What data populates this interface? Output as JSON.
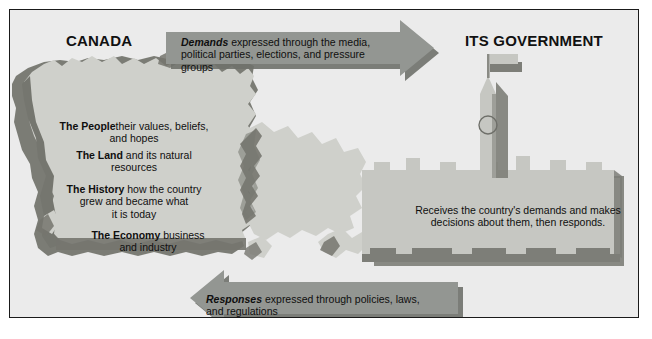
{
  "figure": {
    "background_color": "#ebebeb",
    "frame_color": "#1a1a1a",
    "map_fill": "#cfd0cb",
    "map_shadow": "#75766f",
    "building_fill": "#c6c7c2",
    "building_shadow": "#7d7e78",
    "arrow_fill": "#939692",
    "arrow_shadow": "#6f716c",
    "text_color": "#0f0f0f"
  },
  "titles": {
    "left": "CANADA",
    "right": "ITS GOVERNMENT"
  },
  "flows": [
    {
      "id": "demands",
      "direction": "right",
      "label": "Demands",
      "text": " expressed through the media, political parties, elections, and pressure groups"
    },
    {
      "id": "responses",
      "direction": "left",
      "label": "Responses",
      "text": " expressed through policies, laws, and regulations"
    }
  ],
  "factors": [
    {
      "id": "people",
      "label": "The People",
      "text": "their values, beliefs,\nand hopes"
    },
    {
      "id": "land",
      "label": "The Land",
      "text": " and its natural\nresources"
    },
    {
      "id": "history",
      "label": "The History",
      "text": " how the country\ngrew and became what\nit is today"
    },
    {
      "id": "economy",
      "label": "The Economy",
      "text": " business\nand industry"
    }
  ],
  "government": {
    "description": "Receives the country's demands and makes\ndecisions about them, then responds."
  },
  "icons": {
    "map": "canada-map-silhouette",
    "building": "parliament-building",
    "tower": "peace-tower",
    "clock": "clock-face",
    "flag": "flag"
  }
}
